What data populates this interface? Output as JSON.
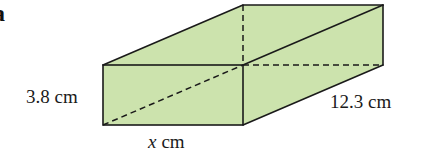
{
  "figure": {
    "part_label": "a",
    "shape": "cuboid",
    "fill_color": "#cce3ad",
    "line_color": "#1a1a1a",
    "dimensions": {
      "height": {
        "value": "3.8",
        "unit": "cm",
        "text": "3.8 cm"
      },
      "length": {
        "value": "12.3",
        "unit": "cm",
        "text": "12.3 cm"
      },
      "width": {
        "variable": "x",
        "unit": "cm"
      }
    }
  }
}
